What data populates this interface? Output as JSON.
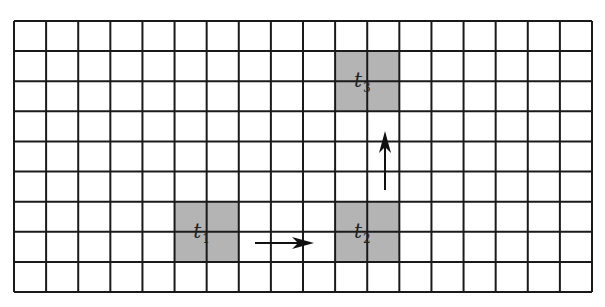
{
  "diagram": {
    "type": "grid-motion",
    "grid": {
      "columns": 18,
      "rows": 9,
      "left": 14,
      "top": 21,
      "right": 592,
      "bottom": 292,
      "line_color": "#1a1a1a",
      "line_width": 2
    },
    "cells": [
      {
        "id": "t1",
        "label": "t",
        "subscript": "1",
        "col": 5,
        "row": 6,
        "colspan": 2,
        "rowspan": 2,
        "fill": "#b4b4b4"
      },
      {
        "id": "t2",
        "label": "t",
        "subscript": "2",
        "col": 10,
        "row": 6,
        "colspan": 2,
        "rowspan": 2,
        "fill": "#b4b4b4"
      },
      {
        "id": "t3",
        "label": "t",
        "subscript": "3",
        "col": 10,
        "row": 1,
        "colspan": 2,
        "rowspan": 2,
        "fill": "#b4b4b4"
      }
    ],
    "arrows": [
      {
        "id": "arrow-t1-to-t2",
        "from": [
          255,
          243
        ],
        "to": [
          314,
          243
        ],
        "direction": "right"
      },
      {
        "id": "arrow-t2-to-t3",
        "from": [
          385,
          190
        ],
        "to": [
          385,
          131
        ],
        "direction": "up"
      }
    ]
  }
}
